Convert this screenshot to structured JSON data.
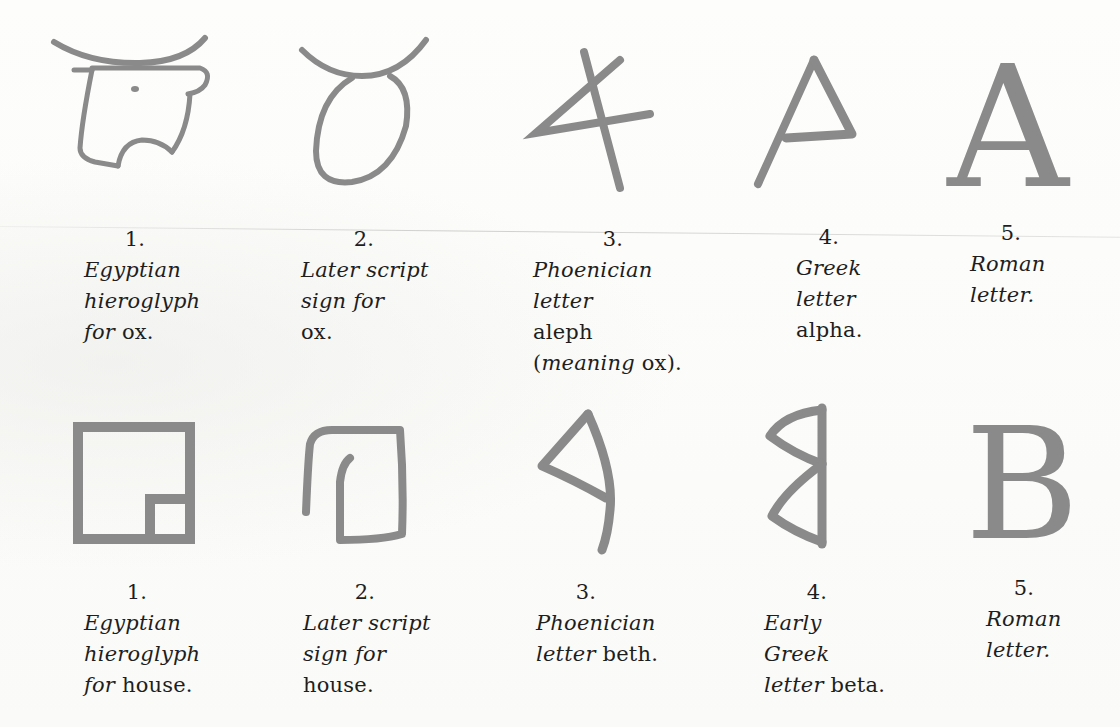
{
  "colors": {
    "ink": "#8a8a8a",
    "text": "#1e1e1e",
    "paper": "#fbfbfa"
  },
  "rows": [
    {
      "name": "ox-series",
      "items": [
        {
          "number": "1.",
          "glyph": "egyptian-hieroglyph-ox-icon",
          "lines": [
            [
              {
                "t": "Egyptian",
                "s": "i"
              }
            ],
            [
              {
                "t": "hieroglyph",
                "s": "i"
              }
            ],
            [
              {
                "t": "for",
                "s": "i"
              },
              {
                "t": " ox.",
                "s": "r"
              }
            ]
          ]
        },
        {
          "number": "2.",
          "glyph": "later-script-ox-icon",
          "lines": [
            [
              {
                "t": "Later script",
                "s": "i"
              }
            ],
            [
              {
                "t": "sign for",
                "s": "i"
              }
            ],
            [
              {
                "t": "ox.",
                "s": "r"
              }
            ]
          ]
        },
        {
          "number": "3.",
          "glyph": "phoenician-aleph-icon",
          "lines": [
            [
              {
                "t": "Phoenician",
                "s": "i"
              }
            ],
            [
              {
                "t": "letter",
                "s": "i"
              }
            ],
            [
              {
                "t": "aleph",
                "s": "r"
              }
            ],
            [
              {
                "t": "(",
                "s": "r"
              },
              {
                "t": "meaning",
                "s": "i"
              },
              {
                "t": " ox).",
                "s": "r"
              }
            ]
          ]
        },
        {
          "number": "4.",
          "glyph": "greek-alpha-icon",
          "lines": [
            [
              {
                "t": "Greek",
                "s": "i"
              }
            ],
            [
              {
                "t": "letter",
                "s": "i"
              }
            ],
            [
              {
                "t": "alpha.",
                "s": "r"
              }
            ]
          ]
        },
        {
          "number": "5.",
          "glyph": "roman-a-icon",
          "glyph_text": "A",
          "lines": [
            [
              {
                "t": "Roman",
                "s": "i"
              }
            ],
            [
              {
                "t": "letter.",
                "s": "i"
              }
            ]
          ]
        }
      ]
    },
    {
      "name": "house-series",
      "items": [
        {
          "number": "1.",
          "glyph": "egyptian-hieroglyph-house-icon",
          "lines": [
            [
              {
                "t": "Egyptian",
                "s": "i"
              }
            ],
            [
              {
                "t": "hieroglyph",
                "s": "i"
              }
            ],
            [
              {
                "t": "for",
                "s": "i"
              },
              {
                "t": " house.",
                "s": "r"
              }
            ]
          ]
        },
        {
          "number": "2.",
          "glyph": "later-script-house-icon",
          "lines": [
            [
              {
                "t": "Later script",
                "s": "i"
              }
            ],
            [
              {
                "t": "sign for",
                "s": "i"
              }
            ],
            [
              {
                "t": "house.",
                "s": "r"
              }
            ]
          ]
        },
        {
          "number": "3.",
          "glyph": "phoenician-beth-icon",
          "lines": [
            [
              {
                "t": "Phoenician",
                "s": "i"
              }
            ],
            [
              {
                "t": "letter",
                "s": "i"
              },
              {
                "t": " beth.",
                "s": "r"
              }
            ]
          ]
        },
        {
          "number": "4.",
          "glyph": "early-greek-beta-icon",
          "lines": [
            [
              {
                "t": "Early",
                "s": "i"
              }
            ],
            [
              {
                "t": "Greek",
                "s": "i"
              }
            ],
            [
              {
                "t": "letter",
                "s": "i"
              },
              {
                "t": " beta.",
                "s": "r"
              }
            ]
          ]
        },
        {
          "number": "5.",
          "glyph": "roman-b-icon",
          "glyph_text": "B",
          "lines": [
            [
              {
                "t": "Roman",
                "s": "i"
              }
            ],
            [
              {
                "t": "letter.",
                "s": "i"
              }
            ]
          ]
        }
      ]
    }
  ]
}
